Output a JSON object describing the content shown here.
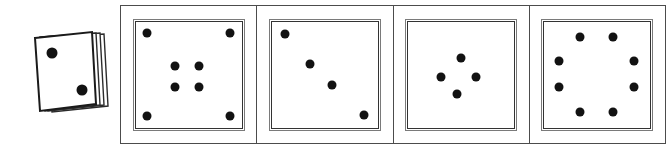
{
  "figure": {
    "title": "",
    "type": "dice-pattern-sequence",
    "background_color": "#ffffff",
    "pip_color": "#121212",
    "card_color": "#ffffff",
    "border_color": "#4c4c4c",
    "inner_border_color": "#333333"
  },
  "prompt": {
    "name": "card-stack",
    "label": "",
    "card_count": 4,
    "visible_face": {
      "pip_count": 2,
      "pips": [
        {
          "id": "pip-1",
          "cx": 22,
          "cy": 25
        },
        {
          "id": "pip-2",
          "cx": 52,
          "cy": 62
        }
      ]
    }
  },
  "sequence": {
    "cell_count": 4,
    "cells": [
      {
        "name": "cell-1",
        "label": "",
        "pip_count": 8,
        "pattern": "four-corners-plus-center-quad",
        "pips": [
          {
            "id": "c1-p1",
            "x": 11,
            "y": 11
          },
          {
            "id": "c1-p2",
            "x": 89,
            "y": 11
          },
          {
            "id": "c1-p3",
            "x": 37,
            "y": 42
          },
          {
            "id": "c1-p4",
            "x": 60,
            "y": 42
          },
          {
            "id": "c1-p5",
            "x": 37,
            "y": 62
          },
          {
            "id": "c1-p6",
            "x": 60,
            "y": 62
          },
          {
            "id": "c1-p7",
            "x": 11,
            "y": 89
          },
          {
            "id": "c1-p8",
            "x": 89,
            "y": 89
          }
        ]
      },
      {
        "name": "cell-2",
        "label": "",
        "pip_count": 4,
        "pattern": "descending-diagonal",
        "pips": [
          {
            "id": "c2-p1",
            "x": 12,
            "y": 12
          },
          {
            "id": "c2-p2",
            "x": 36,
            "y": 40
          },
          {
            "id": "c2-p3",
            "x": 57,
            "y": 60
          },
          {
            "id": "c2-p4",
            "x": 87,
            "y": 88
          }
        ]
      },
      {
        "name": "cell-3",
        "label": "",
        "pip_count": 4,
        "pattern": "small-diamond-center",
        "pips": [
          {
            "id": "c3-p1",
            "x": 50,
            "y": 34
          },
          {
            "id": "c3-p2",
            "x": 31,
            "y": 52
          },
          {
            "id": "c3-p3",
            "x": 64,
            "y": 52
          },
          {
            "id": "c3-p4",
            "x": 46,
            "y": 68
          }
        ]
      },
      {
        "name": "cell-4",
        "label": "",
        "pip_count": 8,
        "pattern": "octagonal-ring",
        "pips": [
          {
            "id": "c4-p1",
            "x": 34,
            "y": 15
          },
          {
            "id": "c4-p2",
            "x": 65,
            "y": 15
          },
          {
            "id": "c4-p3",
            "x": 14,
            "y": 37
          },
          {
            "id": "c4-p4",
            "x": 85,
            "y": 37
          },
          {
            "id": "c4-p5",
            "x": 14,
            "y": 62
          },
          {
            "id": "c4-p6",
            "x": 85,
            "y": 62
          },
          {
            "id": "c4-p7",
            "x": 34,
            "y": 85
          },
          {
            "id": "c4-p8",
            "x": 65,
            "y": 85
          }
        ]
      }
    ]
  }
}
